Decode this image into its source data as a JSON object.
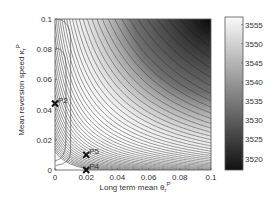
{
  "chart_data": {
    "type": "contour",
    "title": "",
    "xlabel": "Long term mean θ_r^P",
    "ylabel": "Mean reversion speed κ_r^P",
    "xlim": [
      0,
      0.1
    ],
    "ylim": [
      0,
      0.1
    ],
    "xticks": [
      "0",
      "0.02",
      "0.04",
      "0.06",
      "0.08",
      "0.1"
    ],
    "yticks": [
      "0",
      "0.02",
      "0.04",
      "0.06",
      "0.08",
      "0.1"
    ],
    "colorbar": {
      "range": [
        3517,
        3557
      ],
      "ticks": [
        "3520",
        "3525",
        "3530",
        "3535",
        "3540",
        "3545",
        "3550",
        "3555"
      ],
      "colormap": "gray"
    },
    "contour_shape": "hyperbolic level curves (approx. constant θ·κ), density increasing toward top-right; high values (white) near lower-left, low values (dark) at top-right",
    "points": [
      {
        "label": "P2",
        "x": 0.0,
        "y": 0.044
      },
      {
        "label": "P5",
        "x": 0.02,
        "y": 0.01
      },
      {
        "label": "P4",
        "x": 0.02,
        "y": 0.0
      }
    ],
    "grid": false,
    "legend": null
  },
  "labels": {
    "x_main": "Long term mean θ",
    "x_sup": "P",
    "x_sub": "r",
    "y_main": "Mean reversion speed κ",
    "y_sup": "P",
    "y_sub": "r"
  }
}
